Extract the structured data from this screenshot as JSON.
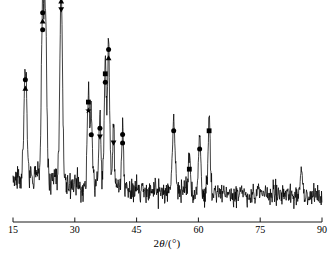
{
  "chart_data": {
    "type": "line",
    "title": "",
    "subtitle": "",
    "xlabel": "2θ/(°)",
    "ylabel": "",
    "xlim": [
      15,
      90
    ],
    "ylim": [
      0,
      100
    ],
    "grid": false,
    "legend_position": "none",
    "x_ticks": [
      15,
      30,
      45,
      60,
      75,
      90
    ],
    "x_tick_labels": [
      "15",
      "30",
      "45",
      "60",
      "75",
      "90"
    ],
    "y_ticks": [],
    "y_tick_labels": [],
    "axis_style": "x-axis only, ticks above axis line, no y-axis",
    "series": [
      {
        "name": "XRD intensity",
        "color": "#000000",
        "description": "X-ray diffraction pattern, counts vs 2-theta, noisy baseline with sharp Bragg peaks",
        "peaks": [
          {
            "x": 18.0,
            "height": 57,
            "width": 0.45,
            "markers": [
              "circle",
              "triangle-up"
            ]
          },
          {
            "x": 22.2,
            "height": 86,
            "width": 0.4,
            "markers": [
              "circle",
              "triangle-up",
              "circle"
            ]
          },
          {
            "x": 22.9,
            "height": 80,
            "width": 0.38,
            "markers": []
          },
          {
            "x": 26.7,
            "height": 96,
            "width": 0.4,
            "markers": [
              "circle",
              "triangle-up",
              "triangle-down"
            ]
          },
          {
            "x": 33.3,
            "height": 46,
            "width": 0.35,
            "markers": [
              "square",
              "star"
            ]
          },
          {
            "x": 34.0,
            "height": 34,
            "width": 0.32,
            "markers": [
              "circle"
            ]
          },
          {
            "x": 36.1,
            "height": 33,
            "width": 0.3,
            "markers": [
              "circle",
              "triangle-down"
            ]
          },
          {
            "x": 37.4,
            "height": 60,
            "width": 0.32,
            "markers": [
              "square",
              "circle"
            ]
          },
          {
            "x": 38.2,
            "height": 72,
            "width": 0.34,
            "markers": [
              "circle",
              "triangle-up"
            ]
          },
          {
            "x": 39.4,
            "height": 30,
            "width": 0.28,
            "markers": [
              "triangle-down"
            ]
          },
          {
            "x": 41.6,
            "height": 30,
            "width": 0.3,
            "markers": [
              "circle",
              "circle"
            ]
          },
          {
            "x": 54.0,
            "height": 36,
            "width": 0.42,
            "markers": [
              "circle"
            ]
          },
          {
            "x": 57.8,
            "height": 17,
            "width": 0.32,
            "markers": [
              "square"
            ]
          },
          {
            "x": 60.3,
            "height": 27,
            "width": 0.35,
            "markers": [
              "circle"
            ]
          },
          {
            "x": 62.6,
            "height": 36,
            "width": 0.35,
            "markers": [
              "square"
            ]
          },
          {
            "x": 85.0,
            "height": 12,
            "width": 0.4,
            "markers": []
          }
        ],
        "baseline": {
          "level_left": 13,
          "level_right": 7,
          "noise_amplitude": 6,
          "description": "broad decaying background with high-frequency noise"
        }
      }
    ],
    "marker_legend": [
      {
        "symbol": "circle",
        "glyph": "●",
        "label": "phase-marker-circle"
      },
      {
        "symbol": "triangle-up",
        "glyph": "▲",
        "label": "phase-marker-triangle-up"
      },
      {
        "symbol": "triangle-down",
        "glyph": "▼",
        "label": "phase-marker-triangle-down"
      },
      {
        "symbol": "square",
        "glyph": "■",
        "label": "phase-marker-square"
      },
      {
        "symbol": "star",
        "glyph": "★",
        "label": "phase-marker-star"
      }
    ],
    "colors": {
      "line": "#000000",
      "axis": "#1a1a1a",
      "background": "#ffffff",
      "text": "#000000"
    }
  },
  "axis": {
    "xlabel_prefix": "2",
    "xlabel_theta": "θ",
    "xlabel_suffix": "/(°)"
  }
}
